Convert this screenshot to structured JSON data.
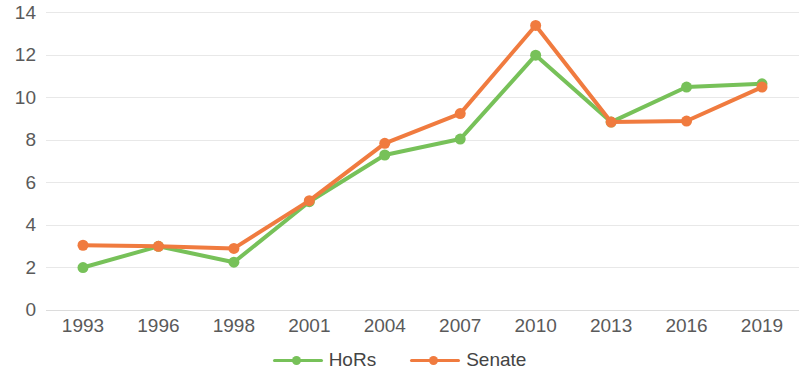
{
  "chart_data": {
    "type": "line",
    "title": "",
    "subtitle": "",
    "xlabel": "",
    "ylabel": "",
    "categories": [
      "1993",
      "1996",
      "1998",
      "2001",
      "2004",
      "2007",
      "2010",
      "2013",
      "2016",
      "2019"
    ],
    "series": [
      {
        "name": "HoRs",
        "color": "#77c159",
        "values": [
          2.0,
          3.0,
          2.25,
          5.1,
          7.3,
          8.05,
          12.0,
          8.85,
          10.5,
          10.65
        ]
      },
      {
        "name": "Senate",
        "color": "#f07b3f",
        "values": [
          3.05,
          3.0,
          2.9,
          5.15,
          7.85,
          9.25,
          13.4,
          8.85,
          8.9,
          10.5
        ]
      }
    ],
    "y_ticks": [
      0,
      2,
      4,
      6,
      8,
      10,
      12,
      14
    ],
    "ylim": [
      0,
      14.6
    ],
    "grid": true,
    "grid_color": "#e8e8e8",
    "legend_position": "bottom",
    "marker": "circle",
    "background_color": "#ffffff",
    "tick_label_color": "#5a5a5a"
  },
  "legend": {
    "entries": [
      {
        "label": "HoRs",
        "color": "#77c159"
      },
      {
        "label": "Senate",
        "color": "#f07b3f"
      }
    ]
  }
}
